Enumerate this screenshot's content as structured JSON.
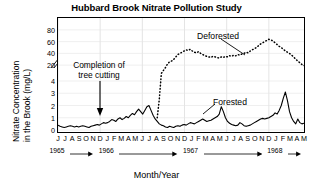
{
  "chart_data": {
    "type": "line",
    "title": "Hubbard Brook Nitrate Pollution Study",
    "xlabel": "Month/Year",
    "ylabel_line1": "Nitrate Concentration",
    "ylabel_line2": "in the Brook (mg/L)",
    "y_axis_broken": true,
    "y_lower_ticks": [
      0,
      1,
      2,
      3,
      4
    ],
    "y_upper_ticks": [
      20,
      40,
      60,
      80
    ],
    "ylim_lower": [
      0,
      4
    ],
    "ylim_upper": [
      10,
      90
    ],
    "grid": true,
    "legend_position": "inline-annotation",
    "month_ticks": [
      "J",
      "J",
      "A",
      "S",
      "O",
      "N",
      "D",
      "J",
      "F",
      "M",
      "A",
      "M",
      "J",
      "J",
      "A",
      "S",
      "O",
      "N",
      "D",
      "J",
      "F",
      "M",
      "A",
      "M",
      "J",
      "J",
      "A",
      "S",
      "O",
      "N",
      "D",
      "J",
      "F",
      "M",
      "A",
      "M"
    ],
    "years": [
      {
        "label": "1965",
        "x_index": 0
      },
      {
        "label": "1966",
        "x_index": 7
      },
      {
        "label": "1967",
        "x_index": 19
      },
      {
        "label": "1968",
        "x_index": 31
      }
    ],
    "annotations": [
      {
        "name": "completion-of-tree-cutting",
        "text_line1": "Completion of",
        "text_line2": "tree cutting",
        "points_to_x_index": 6
      },
      {
        "name": "deforested-label",
        "text": "Deforested"
      },
      {
        "name": "forested-label",
        "text": "Forested"
      }
    ],
    "series": [
      {
        "name": "Forested",
        "style": "solid",
        "color": "#000000",
        "values": [
          0.4,
          0.3,
          0.25,
          0.2,
          0.25,
          0.3,
          0.35,
          0.3,
          0.25,
          0.3,
          0.25,
          0.3,
          0.35,
          0.3,
          0.25,
          0.2,
          0.3,
          0.35,
          0.4,
          0.45,
          0.4,
          0.5,
          0.6,
          0.55,
          0.6,
          0.7,
          0.85,
          0.8,
          0.7,
          0.9,
          1.0,
          0.85,
          0.95,
          1.1,
          1.0,
          1.2,
          1.35,
          1.25,
          1.5,
          1.7,
          1.5,
          1.3,
          1.6,
          1.9,
          2.0,
          1.6,
          1.2,
          0.9,
          0.7,
          0.5,
          0.4,
          0.35,
          0.25,
          0.2,
          0.3,
          0.25,
          0.2,
          0.3,
          0.35,
          0.3,
          0.4,
          0.45,
          0.4,
          0.5,
          0.6,
          0.55,
          0.5,
          0.6,
          0.7,
          0.8,
          0.9,
          0.8,
          0.7,
          0.75,
          0.8,
          0.9,
          1.0,
          1.1,
          1.3,
          1.9,
          1.5,
          1.0,
          0.7,
          0.55,
          0.45,
          0.4,
          0.35,
          0.4,
          0.6,
          0.5,
          0.35,
          0.3,
          0.35,
          0.4,
          0.5,
          0.6,
          0.7,
          0.8,
          0.9,
          0.95,
          0.9,
          0.95,
          1.0,
          1.1,
          1.2,
          1.4,
          1.3,
          1.6,
          2.0,
          2.6,
          3.1,
          2.4,
          1.5,
          1.0,
          0.7,
          0.5,
          0.9,
          0.6,
          0.5,
          0.55
        ]
      },
      {
        "name": "Deforested",
        "style": "dotted",
        "color": "#000000",
        "values": [
          null,
          null,
          null,
          null,
          null,
          null,
          null,
          null,
          null,
          null,
          null,
          null,
          null,
          null,
          null,
          null,
          null,
          null,
          null,
          null,
          null,
          null,
          null,
          null,
          null,
          null,
          null,
          null,
          null,
          null,
          null,
          null,
          null,
          null,
          null,
          null,
          null,
          null,
          null,
          null,
          null,
          null,
          null,
          null,
          null,
          null,
          null,
          null,
          1.0,
          2.5,
          6.0,
          11.0,
          16.0,
          22.0,
          26.0,
          27.0,
          30.0,
          34.0,
          38.0,
          40.0,
          42.0,
          44.0,
          46.0,
          45.0,
          47.0,
          44.0,
          42.0,
          41.0,
          43.0,
          40.0,
          38.0,
          36.0,
          35.0,
          34.0,
          33.0,
          35.0,
          34.0,
          33.0,
          32.0,
          34.0,
          33.0,
          35.0,
          34.0,
          36.0,
          35.0,
          37.0,
          36.0,
          38.0,
          37.0,
          39.0,
          40.0,
          42.0,
          41.0,
          44.0,
          46.0,
          48.0,
          50.0,
          53.0,
          56.0,
          58.0,
          60.0,
          62.0,
          64.0,
          63.0,
          61.0,
          58.0,
          55.0,
          52.0,
          50.0,
          47.0,
          44.0,
          42.0,
          40.0,
          37.0,
          34.0,
          30.0,
          27.0,
          24.0,
          21.0,
          19.0,
          22.0,
          21.0
        ]
      }
    ]
  }
}
